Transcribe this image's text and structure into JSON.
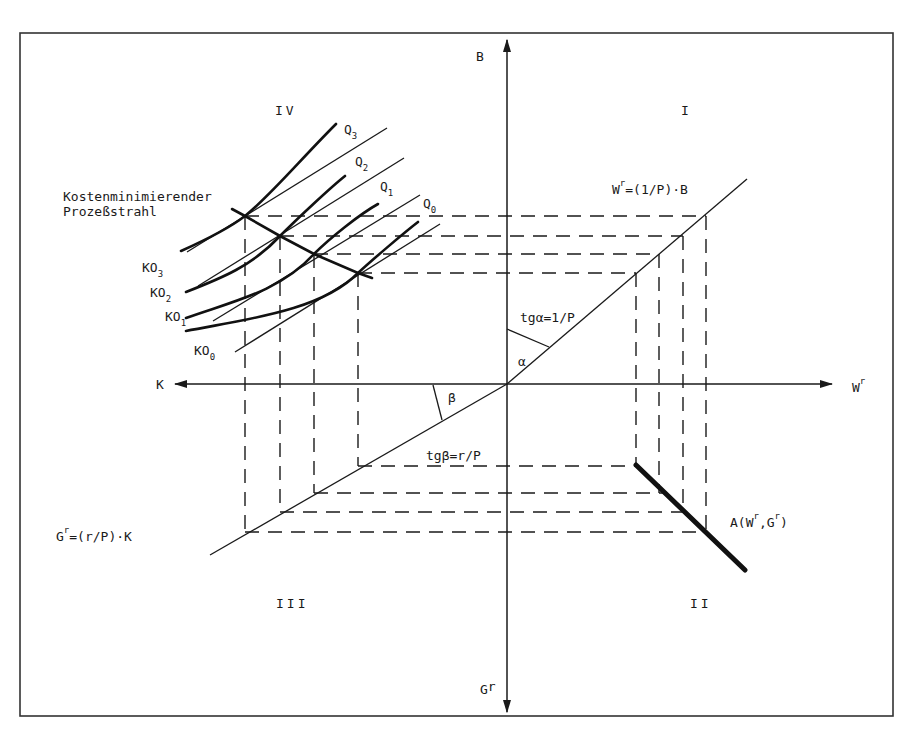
{
  "figure": {
    "type": "four-quadrant economic diagram (cost-minimizing process ray)",
    "quadrants": {
      "I": "I",
      "II": "II",
      "III": "III",
      "IV": "IV"
    },
    "axes": {
      "up": "B",
      "right": "W",
      "right_sup": "r",
      "left": "K",
      "down": "G",
      "down_sup": "r"
    },
    "labels": {
      "ray_title_line1": "Kostenminimierender",
      "ray_title_line2": "Prozeßstrahl",
      "line_I": {
        "base": "W",
        "sup": "r",
        "rest": "=(1/P)·B"
      },
      "line_III": {
        "base": "G",
        "sup": "r",
        "rest": "=(r/P)·K"
      },
      "alpha_eq": "tgα=1/P",
      "alpha": "α",
      "beta_eq": "tgβ=r/P",
      "beta": "β",
      "frontier": {
        "pre": "A(W",
        "sup1": "r",
        "mid": ",G",
        "sup2": "r",
        "post": ")"
      }
    },
    "isoquants": [
      {
        "name": "Q",
        "sub": "0"
      },
      {
        "name": "Q",
        "sub": "1"
      },
      {
        "name": "Q",
        "sub": "2"
      },
      {
        "name": "Q",
        "sub": "3"
      }
    ],
    "isocost_lines": [
      {
        "name": "KO",
        "sub": "0"
      },
      {
        "name": "KO",
        "sub": "1"
      },
      {
        "name": "KO",
        "sub": "2"
      },
      {
        "name": "KO",
        "sub": "3"
      }
    ],
    "colors": {
      "ink": "#1a1a1a",
      "background": "#ffffff",
      "frame": "#333333"
    }
  }
}
